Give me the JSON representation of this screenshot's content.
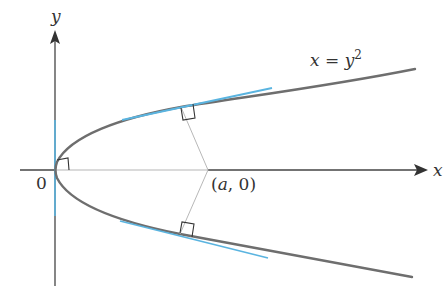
{
  "diagram": {
    "type": "parabola-normal-lines",
    "curve_label": {
      "lhs": "x",
      "eq": " = ",
      "base": "y",
      "exp": "2"
    },
    "axes": {
      "x_label": "x",
      "y_label": "y",
      "origin_label": "0"
    },
    "point_label": {
      "open": "(",
      "var": "a",
      "rest": ", 0)"
    },
    "colors": {
      "curve": "#6e6e6e",
      "axis": "#444444",
      "axis_light": "#b5b5b5",
      "tangent": "#5ab4e0",
      "normal": "#b8b8b8",
      "right_angle": "#333333"
    }
  }
}
